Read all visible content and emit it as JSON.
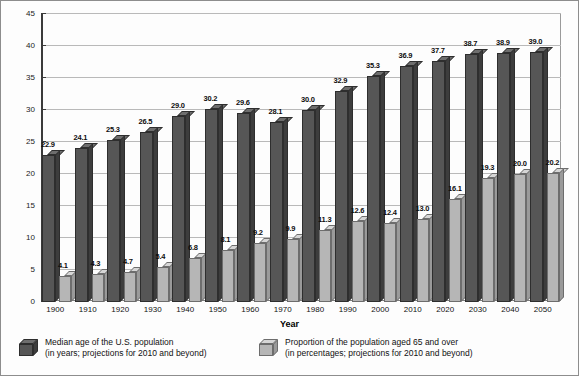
{
  "chart_data": {
    "type": "bar",
    "title": "",
    "xlabel": "Year",
    "ylabel": "",
    "ylim": [
      0,
      45
    ],
    "ytick_step": 5,
    "yticks": [
      0,
      5,
      10,
      15,
      20,
      25,
      30,
      35,
      40,
      45
    ],
    "grid": true,
    "legend_position": "bottom",
    "categories": [
      "1900",
      "1910",
      "1920",
      "1930",
      "1940",
      "1950",
      "1960",
      "1970",
      "1980",
      "1990",
      "2000",
      "2010",
      "2020",
      "2030",
      "2040",
      "2050"
    ],
    "series": [
      {
        "name": "Median age of the U.S. population",
        "units": "years",
        "color": "#565656",
        "values": [
          22.9,
          24.1,
          25.3,
          26.5,
          29.0,
          30.2,
          29.6,
          28.1,
          30.0,
          32.9,
          35.3,
          36.9,
          37.7,
          38.7,
          38.9,
          39.0
        ]
      },
      {
        "name": "Proportion of the population aged 65 and over",
        "units": "percentages",
        "color": "#b6b6b6",
        "values": [
          4.1,
          4.3,
          4.7,
          5.4,
          6.8,
          8.1,
          9.2,
          9.9,
          11.3,
          12.6,
          12.4,
          13.0,
          16.1,
          19.3,
          20.0,
          20.2
        ]
      }
    ]
  },
  "legend": {
    "entries": [
      {
        "line1": "Median age of the U.S. population",
        "line2": "(in years; projections for 2010 and beyond)",
        "swatch": "dark-cube-icon"
      },
      {
        "line1": "Proportion of the population aged 65 and over",
        "line2": "(in percentages; projections for 2010 and beyond)",
        "swatch": "light-cube-icon"
      }
    ]
  },
  "axis": {
    "x_title": "Year"
  }
}
